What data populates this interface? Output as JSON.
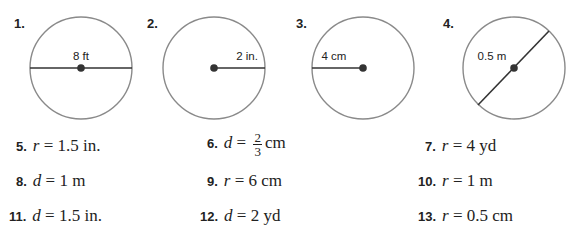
{
  "figures": [
    {
      "number": "1.",
      "label": "8 ft",
      "segment": "diameter-horizontal"
    },
    {
      "number": "2.",
      "label": "2 in.",
      "segment": "radius-right"
    },
    {
      "number": "3.",
      "label": "4 cm",
      "segment": "radius-left"
    },
    {
      "number": "4.",
      "label": "0.5 m",
      "segment": "diameter-diagonal"
    }
  ],
  "problems": [
    {
      "number": "5.",
      "var": "r",
      "eq": " = ",
      "value": "1.5 in."
    },
    {
      "number": "6.",
      "var": "d",
      "eq": " = ",
      "frac_num": "2",
      "frac_den": "3",
      "unit": "cm"
    },
    {
      "number": "7.",
      "var": "r",
      "eq": " = ",
      "value": "4 yd"
    },
    {
      "number": "8.",
      "var": "d",
      "eq": " = ",
      "value": "1 m"
    },
    {
      "number": "9.",
      "var": "r",
      "eq": " = ",
      "value": "6 cm"
    },
    {
      "number": "10.",
      "var": "r",
      "eq": " = ",
      "value": "1 m"
    },
    {
      "number": "11.",
      "var": "d",
      "eq": " = ",
      "value": "1.5 in."
    },
    {
      "number": "12.",
      "var": "d",
      "eq": " = ",
      "value": "2 yd"
    },
    {
      "number": "13.",
      "var": "r",
      "eq": " = ",
      "value": "0.5 cm"
    }
  ],
  "colors": {
    "circle": "#8a8a8a",
    "segment": "#333333",
    "dot": "#333333"
  }
}
